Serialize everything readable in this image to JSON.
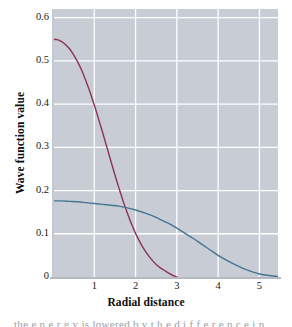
{
  "figure": {
    "background_color": "#fefefe",
    "plot_background_color": "#c7ccd5",
    "grid_color": "#ffffff",
    "axis_color": "#b4b9c2"
  },
  "caption_fragment": "the e n e r g y  is  lowered  b y  t h e  d i f f e r e n c e  i n",
  "chart_data": {
    "type": "line",
    "title": "",
    "xlabel": "Radial distance",
    "ylabel": "Wave function value",
    "xlim": [
      0,
      5.45
    ],
    "ylim": [
      0,
      0.62
    ],
    "xticks": [
      1,
      2,
      3,
      4,
      5
    ],
    "xtick_labels": [
      "1",
      "2",
      "3",
      "4",
      "5"
    ],
    "yticks": [
      0,
      0.1,
      0.2,
      0.3,
      0.4,
      0.5,
      0.6
    ],
    "ytick_labels": [
      "0",
      "0.1",
      "0.2",
      "0.3",
      "0.4",
      "0.5",
      "0.6"
    ],
    "grid": true,
    "grid_axes": "both",
    "legend": "none",
    "series": [
      {
        "name": "1s wave function",
        "color": "#8e3355",
        "line_width": 1.4,
        "x": [
          0.0,
          0.1,
          0.2,
          0.3,
          0.4,
          0.5,
          0.6,
          0.7,
          0.8,
          0.9,
          1.0,
          1.1,
          1.2,
          1.3,
          1.4,
          1.5,
          1.6,
          1.7,
          1.8,
          1.9,
          2.0,
          2.1,
          2.2,
          2.3,
          2.4,
          2.5,
          2.6,
          2.7,
          2.8,
          2.9,
          3.0
        ],
        "y": [
          0.55,
          0.549,
          0.545,
          0.538,
          0.528,
          0.514,
          0.497,
          0.477,
          0.453,
          0.427,
          0.398,
          0.367,
          0.335,
          0.302,
          0.269,
          0.236,
          0.205,
          0.175,
          0.148,
          0.123,
          0.101,
          0.082,
          0.065,
          0.051,
          0.039,
          0.029,
          0.021,
          0.015,
          0.009,
          0.004,
          0.0
        ]
      },
      {
        "name": "2s wave function",
        "color": "#45758f",
        "line_width": 1.4,
        "x": [
          0.0,
          0.2,
          0.4,
          0.6,
          0.8,
          1.0,
          1.2,
          1.4,
          1.6,
          1.8,
          2.0,
          2.2,
          2.4,
          2.6,
          2.8,
          3.0,
          3.2,
          3.4,
          3.6,
          3.8,
          4.0,
          4.2,
          4.4,
          4.6,
          4.8,
          5.0,
          5.2,
          5.45
        ],
        "y": [
          0.176,
          0.176,
          0.175,
          0.174,
          0.172,
          0.17,
          0.168,
          0.166,
          0.164,
          0.16,
          0.155,
          0.149,
          0.142,
          0.133,
          0.124,
          0.113,
          0.101,
          0.089,
          0.076,
          0.063,
          0.05,
          0.039,
          0.029,
          0.02,
          0.013,
          0.007,
          0.004,
          0.001
        ]
      }
    ]
  }
}
